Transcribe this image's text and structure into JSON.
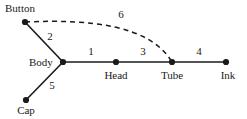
{
  "diagram": {
    "type": "node-link-graph",
    "background_color": "#ffffff",
    "line_color": "#1a1a1a",
    "node_color": "#1a1a1a",
    "text_color": "#1a1a1a",
    "view_box": {
      "width": 247,
      "height": 119
    },
    "nodes": [
      {
        "id": "button",
        "label": "Button",
        "x": 25,
        "y": 22,
        "label_x": 5,
        "label_y": 2,
        "label_align": "left"
      },
      {
        "id": "body",
        "label": "Body",
        "x": 63,
        "y": 62,
        "label_x": 58,
        "label_y": 56,
        "label_align": "right"
      },
      {
        "id": "cap",
        "label": "Cap",
        "x": 26,
        "y": 100,
        "label_x": 26,
        "label_y": 104,
        "label_align": "center"
      },
      {
        "id": "head",
        "label": "Head",
        "x": 116,
        "y": 62,
        "label_x": 116,
        "label_y": 69,
        "label_align": "center"
      },
      {
        "id": "tube",
        "label": "Tube",
        "x": 172,
        "y": 62,
        "label_x": 172,
        "label_y": 69,
        "label_align": "center"
      },
      {
        "id": "ink",
        "label": "Ink",
        "x": 226,
        "y": 62,
        "label_x": 228,
        "label_y": 69,
        "label_align": "center"
      }
    ],
    "edges": [
      {
        "id": "e1",
        "label": "1",
        "from": "body",
        "to": "head",
        "style": "solid",
        "label_x": 91,
        "label_y": 47
      },
      {
        "id": "e2",
        "label": "2",
        "from": "button",
        "to": "body",
        "style": "solid",
        "label_x": 50,
        "label_y": 31
      },
      {
        "id": "e3",
        "label": "3",
        "from": "head",
        "to": "tube",
        "style": "solid",
        "label_x": 143,
        "label_y": 47
      },
      {
        "id": "e4",
        "label": "4",
        "from": "tube",
        "to": "ink",
        "style": "solid",
        "label_x": 199,
        "label_y": 47
      },
      {
        "id": "e5",
        "label": "5",
        "from": "body",
        "to": "cap",
        "style": "solid",
        "label_x": 52,
        "label_y": 80
      },
      {
        "id": "e6",
        "label": "6",
        "from": "button",
        "to": "tube",
        "style": "dashed",
        "label_x": 121,
        "label_y": 9
      }
    ]
  }
}
